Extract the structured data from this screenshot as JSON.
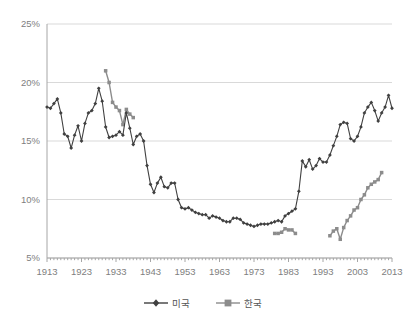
{
  "chart_data": {
    "type": "line",
    "title": "",
    "xlabel": "",
    "ylabel": "",
    "xlim": [
      1913,
      2013
    ],
    "ylim": [
      5,
      25
    ],
    "ytick_labels": [
      "25%",
      "20%",
      "15%",
      "10%",
      "5%"
    ],
    "ytick_values": [
      25,
      20,
      15,
      10,
      5
    ],
    "xtick_labels": [
      "1913",
      "1923",
      "1933",
      "1943",
      "1953",
      "1963",
      "1973",
      "1983",
      "1993",
      "2003",
      "2013"
    ],
    "xtick_values": [
      1913,
      1923,
      1933,
      1943,
      1953,
      1963,
      1973,
      1983,
      1993,
      2003,
      2013
    ],
    "grid": "horizontal",
    "legend_position": "bottom",
    "series": [
      {
        "name": "미국",
        "color": "#404040",
        "marker": "diamond",
        "x": [
          1913,
          1914,
          1915,
          1916,
          1917,
          1918,
          1919,
          1920,
          1921,
          1922,
          1923,
          1924,
          1925,
          1926,
          1927,
          1928,
          1929,
          1930,
          1931,
          1932,
          1933,
          1934,
          1935,
          1936,
          1937,
          1938,
          1939,
          1940,
          1941,
          1942,
          1943,
          1944,
          1945,
          1946,
          1947,
          1948,
          1949,
          1950,
          1951,
          1952,
          1953,
          1954,
          1955,
          1956,
          1957,
          1958,
          1959,
          1960,
          1961,
          1962,
          1963,
          1964,
          1965,
          1966,
          1967,
          1968,
          1969,
          1970,
          1971,
          1972,
          1973,
          1974,
          1975,
          1976,
          1977,
          1978,
          1979,
          1980,
          1981,
          1982,
          1983,
          1984,
          1985,
          1986,
          1987,
          1988,
          1989,
          1990,
          1991,
          1992,
          1993,
          1994,
          1995,
          1996,
          1997,
          1998,
          1999,
          2000,
          2001,
          2002,
          2003,
          2004,
          2005,
          2006,
          2007,
          2008,
          2009,
          2010,
          2011,
          2012,
          2013
        ],
        "y": [
          17.9,
          17.8,
          18.2,
          18.6,
          17.4,
          15.6,
          15.4,
          14.4,
          15.5,
          16.3,
          15.0,
          16.5,
          17.4,
          17.6,
          18.2,
          19.5,
          18.4,
          16.2,
          15.3,
          15.4,
          15.5,
          15.8,
          15.5,
          17.4,
          16.1,
          14.7,
          15.4,
          15.6,
          15.0,
          12.9,
          11.3,
          10.6,
          11.4,
          11.9,
          11.1,
          11.0,
          11.4,
          11.4,
          10.0,
          9.3,
          9.2,
          9.3,
          9.1,
          8.9,
          8.8,
          8.7,
          8.7,
          8.4,
          8.6,
          8.5,
          8.4,
          8.2,
          8.1,
          8.1,
          8.4,
          8.4,
          8.3,
          8.0,
          7.9,
          7.8,
          7.7,
          7.8,
          7.9,
          7.9,
          7.9,
          8.0,
          8.1,
          8.2,
          8.1,
          8.6,
          8.8,
          9.0,
          9.2,
          10.7,
          13.3,
          12.8,
          13.4,
          12.6,
          12.9,
          13.5,
          13.2,
          13.2,
          13.8,
          14.6,
          15.4,
          16.4,
          16.6,
          16.5,
          15.2,
          15.0,
          15.4,
          16.2,
          17.4,
          17.9,
          18.3,
          17.6,
          16.7,
          17.4,
          17.9,
          18.9,
          17.8
        ]
      },
      {
        "name": "한국",
        "color": "#8c8c8c",
        "marker": "square",
        "segments": [
          {
            "x": [
              1930,
              1931,
              1932,
              1933,
              1934,
              1935,
              1936,
              1937,
              1938
            ],
            "y": [
              21.0,
              20.0,
              18.3,
              17.9,
              17.6,
              16.4,
              17.7,
              17.3,
              17.0
            ]
          },
          {
            "x": [
              1979,
              1980,
              1981,
              1982,
              1983,
              1984,
              1985
            ],
            "y": [
              7.1,
              7.1,
              7.2,
              7.5,
              7.4,
              7.4,
              7.1
            ]
          },
          {
            "x": [
              1995,
              1996,
              1997,
              1998,
              1999,
              2000,
              2001,
              2002,
              2003,
              2004,
              2005,
              2006,
              2007,
              2008,
              2009,
              2010
            ],
            "y": [
              6.9,
              7.3,
              7.5,
              6.6,
              7.6,
              8.2,
              8.6,
              9.1,
              9.3,
              10.0,
              10.4,
              11.0,
              11.3,
              11.5,
              11.7,
              12.3
            ]
          }
        ]
      }
    ]
  },
  "axis_style": {
    "grid_color": "#d9d9d9",
    "axis_color": "#a6a6a6",
    "tick_text_color": "#808080"
  }
}
